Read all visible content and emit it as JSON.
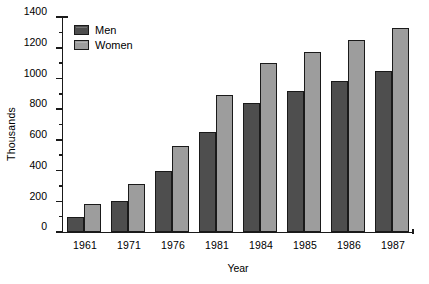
{
  "chart_data": {
    "type": "bar",
    "title": "",
    "xlabel": "Year",
    "ylabel": "Thousands",
    "categories": [
      "1961",
      "1971",
      "1976",
      "1981",
      "1984",
      "1985",
      "1986",
      "1987"
    ],
    "series": [
      {
        "name": "Men",
        "color": "#4e4e4e",
        "values": [
          100,
          200,
          400,
          650,
          840,
          920,
          985,
          1050
        ]
      },
      {
        "name": "Women",
        "color": "#9d9d9d",
        "values": [
          180,
          310,
          560,
          890,
          1100,
          1175,
          1250,
          1330
        ]
      }
    ],
    "ylim": [
      0,
      1400
    ],
    "ytick_labels": [
      "0",
      "200",
      "400",
      "600",
      "800",
      "1000",
      "1200",
      "1400"
    ],
    "ytick_values": [
      0,
      200,
      400,
      600,
      800,
      1000,
      1200,
      1400
    ],
    "yminor_values": [
      100,
      300,
      500,
      700,
      900,
      1100,
      1300
    ],
    "grid": false,
    "legend_position": "top-left",
    "legend": [
      "Men",
      "Women"
    ]
  }
}
